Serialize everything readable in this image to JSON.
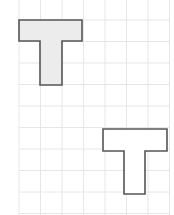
{
  "diagram": {
    "type": "grid-shapes",
    "width": 174,
    "height": 215,
    "grid": {
      "origin_x": 19,
      "origin_y": -1.5,
      "cell": 21.5,
      "cols": 7,
      "rows": 10,
      "line_color": "#e6e6e6"
    },
    "shapes": [
      {
        "name": "t-shape-shaded",
        "fill": "#ececec",
        "stroke": "#555555",
        "points": [
          [
            19,
            20
          ],
          [
            82,
            20
          ],
          [
            82,
            41
          ],
          [
            62,
            41
          ],
          [
            62,
            85
          ],
          [
            40,
            85
          ],
          [
            40,
            41
          ],
          [
            19,
            41
          ]
        ]
      },
      {
        "name": "t-shape-outline",
        "fill": "#ffffff",
        "stroke": "#555555",
        "points": [
          [
            103,
            129
          ],
          [
            167,
            129
          ],
          [
            167,
            151
          ],
          [
            145,
            151
          ],
          [
            145,
            194
          ],
          [
            124,
            194
          ],
          [
            124,
            151
          ],
          [
            103,
            151
          ]
        ]
      }
    ]
  }
}
